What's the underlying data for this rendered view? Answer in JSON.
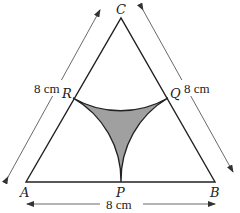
{
  "diagram": {
    "vertices": {
      "A": {
        "label": "A"
      },
      "B": {
        "label": "B"
      },
      "C": {
        "label": "C"
      }
    },
    "midpoints": {
      "P": {
        "label": "P"
      },
      "Q": {
        "label": "Q"
      },
      "R": {
        "label": "R"
      }
    },
    "dimensions": {
      "left_side": "8 cm",
      "right_side": "8 cm",
      "base": "8 cm"
    },
    "colors": {
      "shaded_region": "#a0a0a0",
      "lines": "#222222",
      "dimension_arrows": "#444444"
    }
  }
}
